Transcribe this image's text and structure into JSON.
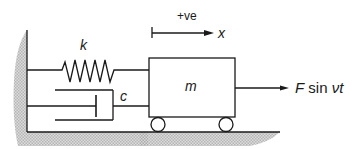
{
  "diagram": {
    "title": "",
    "type": "spring-mass-damper system with harmonic forcing",
    "labels": {
      "spring": "k",
      "damper": "c",
      "mass": "m",
      "direction_sign": "+ve",
      "displacement": "x",
      "force_F": "F",
      "force_sin": "sin",
      "force_arg": "νt"
    },
    "components": [
      {
        "id": "wall",
        "kind": "fixed support (hatched)"
      },
      {
        "id": "spring",
        "kind": "spring",
        "label": "k"
      },
      {
        "id": "damper",
        "kind": "viscous damper / dashpot",
        "label": "c"
      },
      {
        "id": "mass",
        "kind": "cart on wheels",
        "label": "m"
      },
      {
        "id": "floor",
        "kind": "ground (hatched)"
      },
      {
        "id": "force",
        "kind": "applied harmonic force",
        "label": "F sin νt"
      },
      {
        "id": "positive-direction",
        "kind": "arrow",
        "label": "+ve",
        "variable": "x"
      }
    ],
    "colors": {
      "line": "#1a1a1a",
      "hatch": "#b5b5b5",
      "background": "#ffffff"
    }
  }
}
